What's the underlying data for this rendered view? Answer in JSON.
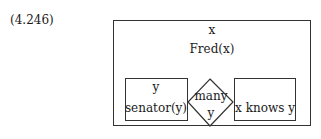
{
  "equation_number": "(4.246)",
  "outer_box": {
    "referent": "x",
    "condition": "Fred(x)"
  },
  "left_box": {
    "referent": "y",
    "condition": "senator(y)"
  },
  "quantifier": {
    "label": "many",
    "variable": "y"
  },
  "right_box": {
    "condition": "x knows y"
  }
}
